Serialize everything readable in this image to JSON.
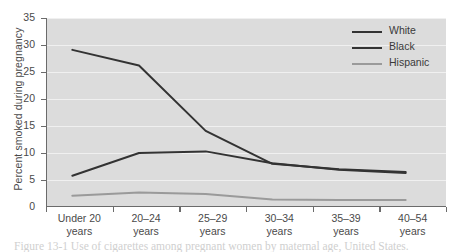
{
  "chart_data": {
    "type": "line",
    "title": "",
    "xlabel": "",
    "ylabel": "Percent smoked during pregnancy",
    "categories": [
      "Under 20 years",
      "20–24 years",
      "25–29 years",
      "30–34 years",
      "35–39 years",
      "40–54 years"
    ],
    "category_lines": [
      {
        "line1": "Under 20",
        "line2": "years"
      },
      {
        "line1": "20–24",
        "line2": "years"
      },
      {
        "line1": "25–29",
        "line2": "years"
      },
      {
        "line1": "30–34",
        "line2": "years"
      },
      {
        "line1": "35–39",
        "line2": "years"
      },
      {
        "line1": "40–54",
        "line2": "years"
      }
    ],
    "series": [
      {
        "name": "White",
        "values": [
          29.1,
          26.2,
          14.1,
          8.0,
          7.0,
          6.5
        ],
        "color": "#333333"
      },
      {
        "name": "Black",
        "values": [
          5.8,
          10.0,
          10.3,
          8.1,
          6.9,
          6.3
        ],
        "color": "#333333"
      },
      {
        "name": "Hispanic",
        "values": [
          2.1,
          2.7,
          2.4,
          1.4,
          1.3,
          1.3
        ],
        "color": "#9a9a9a"
      }
    ],
    "ylim": [
      0,
      35
    ],
    "yticks": [
      0,
      5,
      10,
      15,
      20,
      25,
      30,
      35
    ],
    "ytick_labels": [
      "0",
      "5",
      "10",
      "15",
      "20",
      "25",
      "30",
      "35"
    ],
    "grid": true,
    "grid_color": "#f0f0f0",
    "plot_background": "#dcdcdc",
    "axis_color": "#6b6b6b",
    "legend_position": "top-right",
    "legend": [
      {
        "label": "White",
        "color": "#333333"
      },
      {
        "label": "Black",
        "color": "#333333"
      },
      {
        "label": "Hispanic",
        "color": "#9a9a9a"
      }
    ]
  },
  "caption": {
    "text": "Figure 13-1   Use of cigarettes among pregnant women by maternal age, United States."
  }
}
